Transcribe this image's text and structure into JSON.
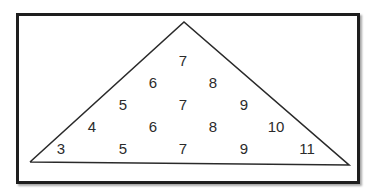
{
  "diagram": {
    "shape": "triangle",
    "rows": [
      {
        "values": [
          "7"
        ]
      },
      {
        "values": [
          "6",
          "8"
        ]
      },
      {
        "values": [
          "5",
          "7",
          "9"
        ]
      },
      {
        "values": [
          "4",
          "6",
          "8",
          "10"
        ]
      },
      {
        "values": [
          "3",
          "5",
          "7",
          "9",
          "11"
        ]
      }
    ]
  }
}
